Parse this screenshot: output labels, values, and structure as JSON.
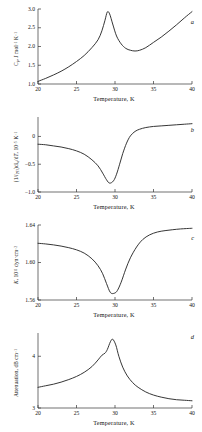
{
  "figure": {
    "xlabel": "Temperature, K",
    "xticks": [
      "20",
      "25",
      "30",
      "35",
      "40"
    ],
    "xlim": [
      20,
      40
    ],
    "line_color": "#2b2b2b",
    "background": "#ffffff"
  },
  "panels": [
    {
      "letter": "a",
      "ylabel_html": "C<sub>p</sub>, J mol<sup>&minus;1</sup> K<sup>&minus;1</sup>",
      "yticks": [
        "1.0",
        "1.5",
        "2.0",
        "2.5",
        "3.0"
      ]
    },
    {
      "letter": "b",
      "ylabel_html": "(1/<i>l</i><sub>293</sub>)d<i>l</i><sub>a</sub>/d<i>T</i>, 10<sup>&minus;5</sup> K<sup>&minus;1</sup>",
      "yticks": [
        "&minus;1.0",
        "&minus;0.5",
        "0"
      ]
    },
    {
      "letter": "c",
      "ylabel_html": "<i>K</i>, 10<sup>11</sup> dyn&middot;cm<sup>&minus;2</sup>",
      "yticks": [
        "1.56",
        "1.60",
        "1.64"
      ]
    },
    {
      "letter": "d",
      "ylabel_html": "Attenuation, dB cm<sup>&minus;1</sup>",
      "yticks": [
        "3",
        "4"
      ]
    }
  ],
  "chart_data": [
    {
      "type": "line",
      "panel": "a",
      "title": "",
      "xlabel": "Temperature, K",
      "ylabel": "Cp, J mol-1 K-1",
      "xlim": [
        20,
        40
      ],
      "ylim": [
        1.0,
        3.0
      ],
      "yticks": [
        1.0,
        1.5,
        2.0,
        2.5,
        3.0
      ],
      "xticks": [
        20,
        25,
        30,
        35,
        40
      ],
      "grid": false,
      "legend": "none",
      "annotation": "lambda-like heat capacity anomaly peaking near 29 K",
      "x": [
        20,
        21,
        22,
        23,
        24,
        25,
        26,
        27,
        27.8,
        28.3,
        28.7,
        29.0,
        29.3,
        29.7,
        30.2,
        30.8,
        31.4,
        32.0,
        32.6,
        33.2,
        34,
        35,
        36,
        37,
        38,
        39,
        40
      ],
      "y": [
        1.07,
        1.15,
        1.24,
        1.34,
        1.46,
        1.6,
        1.76,
        1.97,
        2.18,
        2.42,
        2.7,
        2.92,
        2.87,
        2.6,
        2.28,
        2.07,
        1.95,
        1.9,
        1.88,
        1.9,
        1.97,
        2.11,
        2.25,
        2.41,
        2.58,
        2.76,
        2.93
      ]
    },
    {
      "type": "line",
      "panel": "b",
      "title": "",
      "xlabel": "Temperature, K",
      "ylabel": "(1/l293)dla/dT, 10-5 K-1",
      "xlim": [
        20,
        40
      ],
      "ylim": [
        -1.0,
        0.35
      ],
      "yticks": [
        -1.0,
        -0.5,
        0
      ],
      "xticks": [
        20,
        25,
        30,
        35,
        40
      ],
      "grid": false,
      "legend": "none",
      "annotation": "negative thermal-expansion dip minimum about -0.84 near 29.3 K",
      "x": [
        20,
        21,
        22,
        23,
        24,
        25,
        26,
        27,
        27.8,
        28.4,
        28.9,
        29.3,
        29.8,
        30.2,
        30.6,
        31.0,
        31.5,
        32.0,
        32.6,
        33.2,
        34,
        35,
        36,
        37,
        38,
        39,
        40
      ],
      "y": [
        -0.14,
        -0.15,
        -0.17,
        -0.19,
        -0.22,
        -0.26,
        -0.32,
        -0.42,
        -0.53,
        -0.66,
        -0.78,
        -0.84,
        -0.8,
        -0.68,
        -0.5,
        -0.31,
        -0.12,
        0.01,
        0.09,
        0.13,
        0.16,
        0.18,
        0.19,
        0.2,
        0.21,
        0.22,
        0.23
      ]
    },
    {
      "type": "line",
      "panel": "c",
      "title": "",
      "xlabel": "Temperature, K",
      "ylabel": "K, 10^11 dyn cm-2",
      "xlim": [
        20,
        40
      ],
      "ylim": [
        1.56,
        1.64
      ],
      "yticks": [
        1.56,
        1.6,
        1.64
      ],
      "xticks": [
        20,
        25,
        30,
        35,
        40
      ],
      "grid": false,
      "legend": "none",
      "annotation": "bulk modulus softening minimum about 1.567 near 29.4 K",
      "x": [
        20,
        21,
        22,
        23,
        24,
        25,
        26,
        27,
        27.8,
        28.4,
        28.9,
        29.4,
        29.9,
        30.3,
        30.8,
        31.4,
        32.0,
        32.8,
        33.6,
        34.5,
        35.5,
        36.5,
        37.5,
        38.5,
        39.3,
        40
      ],
      "y": [
        1.6205,
        1.6198,
        1.6188,
        1.6175,
        1.6158,
        1.6135,
        1.61,
        1.604,
        1.5965,
        1.588,
        1.5775,
        1.568,
        1.5672,
        1.57,
        1.579,
        1.593,
        1.605,
        1.6165,
        1.6245,
        1.6295,
        1.6325,
        1.634,
        1.635,
        1.6358,
        1.6362,
        1.6365
      ]
    },
    {
      "type": "line",
      "panel": "d",
      "title": "",
      "xlabel": "Temperature, K",
      "ylabel": "Attenuation, dB cm-1",
      "xlim": [
        20,
        40
      ],
      "ylim": [
        3,
        4.45
      ],
      "yticks": [
        3,
        4
      ],
      "xticks": [
        20,
        25,
        30,
        35,
        40
      ],
      "grid": false,
      "legend": "none",
      "annotation": "ultrasonic attenuation peak about 4.33 near 29.6 K",
      "x": [
        20,
        21,
        22,
        23,
        24,
        25,
        26,
        27,
        27.8,
        28.3,
        28.7,
        29.0,
        29.4,
        29.7,
        30.1,
        30.5,
        31.0,
        31.6,
        32.3,
        33.0,
        34,
        35,
        36,
        37,
        38,
        39,
        40
      ],
      "y": [
        3.4,
        3.43,
        3.46,
        3.5,
        3.55,
        3.61,
        3.69,
        3.8,
        3.93,
        4.02,
        4.06,
        4.13,
        4.28,
        4.33,
        4.22,
        4.0,
        3.79,
        3.62,
        3.49,
        3.4,
        3.31,
        3.25,
        3.21,
        3.18,
        3.16,
        3.15,
        3.14
      ]
    }
  ]
}
